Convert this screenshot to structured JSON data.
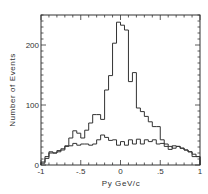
{
  "chart_data": {
    "type": "histogram",
    "title": "",
    "xlabel": "Py GeV/c",
    "ylabel": "Number of Events",
    "xlim": [
      -1,
      1
    ],
    "ylim": [
      0,
      250
    ],
    "grid": false,
    "legend": null,
    "x_ticks": [
      -1,
      -0.5,
      0,
      0.5,
      1
    ],
    "x_tick_labels": [
      "-1",
      "-.5",
      "0",
      ".5",
      "1"
    ],
    "x_minor_step": 0.1,
    "y_ticks": [
      0,
      100,
      200
    ],
    "y_tick_labels": [
      "0",
      "100",
      "200"
    ],
    "y_minor_step": 10,
    "bin_edges_start": -1,
    "bin_width": 0.05,
    "series": [
      {
        "name": "peaked distribution",
        "values": [
          5,
          11,
          20,
          20,
          24,
          27,
          32,
          45,
          57,
          53,
          45,
          58,
          70,
          84,
          84,
          76,
          125,
          149,
          203,
          238,
          233,
          225,
          139,
          154,
          95,
          89,
          81,
          72,
          64,
          64,
          42,
          35,
          26,
          32,
          31,
          28,
          25,
          22,
          18,
          14
        ]
      },
      {
        "name": "flat distribution",
        "values": [
          3,
          14,
          22,
          20,
          22,
          25,
          31,
          32,
          36,
          33,
          35,
          35,
          33,
          35,
          42,
          50,
          46,
          41,
          42,
          33,
          39,
          33,
          42,
          35,
          43,
          35,
          42,
          39,
          42,
          35,
          36,
          31,
          31,
          28,
          31,
          28,
          25,
          22,
          14,
          14
        ]
      }
    ]
  }
}
